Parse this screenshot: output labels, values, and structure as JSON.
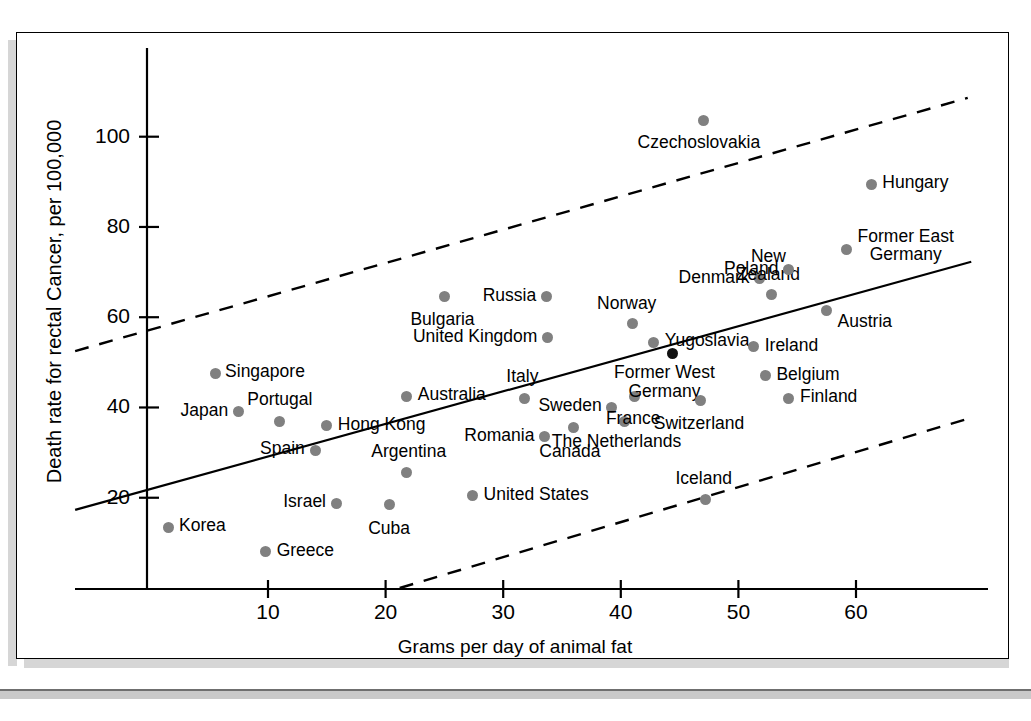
{
  "figure": {
    "xlabel": "Grams per day of animal fat",
    "ylabel": "Death rate for rectal Cancer, per 100,000"
  },
  "chart_data": {
    "type": "scatter",
    "title": "",
    "xlabel": "Grams per day of animal fat",
    "ylabel": "Death rate for rectal Cancer, per 100,000",
    "xlim": [
      -6.5,
      71
    ],
    "ylim": [
      0,
      112
    ],
    "xticks": [
      10,
      20,
      30,
      40,
      50,
      60
    ],
    "yticks": [
      20,
      40,
      60,
      80,
      100
    ],
    "grid": false,
    "legend": null,
    "points": [
      {
        "label": "Korea",
        "x": 1.5,
        "y": 13.5
      },
      {
        "label": "Singapore",
        "x": 5.5,
        "y": 47.5
      },
      {
        "label": "Japan",
        "x": 7.5,
        "y": 39.0
      },
      {
        "label": "Greece",
        "x": 9.8,
        "y": 8.0
      },
      {
        "label": "Portugal",
        "x": 11.0,
        "y": 37.0
      },
      {
        "label": "Spain",
        "x": 14.0,
        "y": 30.5
      },
      {
        "label": "Hong Kong",
        "x": 15.0,
        "y": 36.0
      },
      {
        "label": "Israel",
        "x": 15.8,
        "y": 18.8
      },
      {
        "label": "Cuba",
        "x": 20.3,
        "y": 18.5
      },
      {
        "label": "Argentina",
        "x": 21.8,
        "y": 25.5
      },
      {
        "label": "Australia",
        "x": 21.8,
        "y": 42.5
      },
      {
        "label": "Bulgaria",
        "x": 25.0,
        "y": 64.5
      },
      {
        "label": "United States",
        "x": 27.4,
        "y": 20.5
      },
      {
        "label": "Italy",
        "x": 31.8,
        "y": 42.0
      },
      {
        "label": "Romania",
        "x": 33.5,
        "y": 33.5
      },
      {
        "label": "Russia",
        "x": 33.7,
        "y": 64.5
      },
      {
        "label": "United Kingdom",
        "x": 33.8,
        "y": 55.5
      },
      {
        "label": "Canada",
        "x": 36.0,
        "y": 35.5
      },
      {
        "label": "Sweden",
        "x": 39.2,
        "y": 40.0
      },
      {
        "label": "The Netherlands",
        "x": 40.3,
        "y": 37.0
      },
      {
        "label": "Norway",
        "x": 41.0,
        "y": 58.5
      },
      {
        "label": "France",
        "x": 41.2,
        "y": 42.5
      },
      {
        "label": "Yugoslavia",
        "x": 42.8,
        "y": 54.5
      },
      {
        "label": "Former West Germany",
        "x": 44.4,
        "y": 52.0,
        "highlight": true
      },
      {
        "label": "Switzerland",
        "x": 46.8,
        "y": 41.5
      },
      {
        "label": "Czechoslovakia",
        "x": 47.0,
        "y": 103.5
      },
      {
        "label": "Iceland",
        "x": 47.2,
        "y": 19.5
      },
      {
        "label": "Ireland",
        "x": 51.3,
        "y": 53.5
      },
      {
        "label": "Denmark",
        "x": 51.8,
        "y": 68.5
      },
      {
        "label": "Belgium",
        "x": 52.3,
        "y": 47.0
      },
      {
        "label": "New Zealand",
        "x": 52.8,
        "y": 65.0
      },
      {
        "label": "Finland",
        "x": 54.3,
        "y": 42.0
      },
      {
        "label": "Poland",
        "x": 54.3,
        "y": 70.5
      },
      {
        "label": "Former East Germany",
        "x": 59.2,
        "y": 75.0
      },
      {
        "label": "Austria",
        "x": 57.5,
        "y": 61.5
      },
      {
        "label": "Hungary",
        "x": 61.3,
        "y": 89.5
      }
    ],
    "lines": [
      {
        "name": "regression-line",
        "style": "solid",
        "x1": -6.4,
        "y1": 17.3,
        "x2": 69.8,
        "y2": 72.3
      },
      {
        "name": "upper-confidence-band",
        "style": "dashed",
        "x1": -6.4,
        "y1": 52.5,
        "x2": 69.5,
        "y2": 108.6
      },
      {
        "name": "lower-confidence-band",
        "style": "dashed",
        "x1": 21.2,
        "y1": 0.0,
        "x2": 69.5,
        "y2": 37.5
      }
    ]
  }
}
